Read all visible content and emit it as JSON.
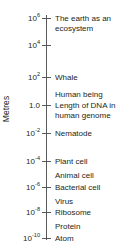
{
  "chart_data": {
    "type": "scatter",
    "title": "",
    "orientation": "vertical",
    "scale": "log10",
    "ylabel": "Metres",
    "ylim": [
      1e-10,
      1000000.0
    ],
    "grid": false,
    "legend": null,
    "axis_ticks": [
      {
        "label_base": "10",
        "label_exp": "6",
        "plain": "10^6",
        "value": 1000000.0,
        "y": 18
      },
      {
        "label_base": "10",
        "label_exp": "4",
        "plain": "10^4",
        "value": 10000.0,
        "y": 45
      },
      {
        "label_base": "10",
        "label_exp": "2",
        "plain": "10^2",
        "value": 100,
        "y": 77
      },
      {
        "label_base": "1.0",
        "label_exp": "",
        "plain": "1.0",
        "value": 1,
        "y": 105
      },
      {
        "label_base": "10",
        "label_exp": "-2",
        "plain": "10^-2",
        "value": 0.01,
        "y": 133
      },
      {
        "label_base": "10",
        "label_exp": "-4",
        "plain": "10^-4",
        "value": 0.0001,
        "y": 161
      },
      {
        "label_base": "10",
        "label_exp": "-6",
        "plain": "10^-6",
        "value": 1e-06,
        "y": 187
      },
      {
        "label_base": "10",
        "label_exp": "-8",
        "plain": "10^-8",
        "value": 1e-08,
        "y": 212
      },
      {
        "label_base": "10",
        "label_exp": "-10",
        "plain": "10^-10",
        "value": 1e-10,
        "y": 238
      }
    ],
    "annotations": [
      {
        "text": "The earth as an ecosystem",
        "value": 1000000.0,
        "y": 14,
        "at_tick": true
      },
      {
        "text": "Whale",
        "value": 100,
        "y": 73,
        "at_tick": true
      },
      {
        "text": "Human being",
        "value": 2,
        "y": 90,
        "at_tick": false
      },
      {
        "text": "Length of DNA in\nhuman genome",
        "value": 1,
        "y": 101,
        "at_tick": true
      },
      {
        "text": "Nematode",
        "value": 0.01,
        "y": 129,
        "at_tick": true
      },
      {
        "text": "Plant cell",
        "value": 0.0001,
        "y": 157,
        "at_tick": true
      },
      {
        "text": "Animal cell",
        "value": 1e-05,
        "y": 171,
        "at_tick": false
      },
      {
        "text": "Bacterial cell",
        "value": 1e-06,
        "y": 183,
        "at_tick": true
      },
      {
        "text": "Virus",
        "value": 1e-07,
        "y": 197,
        "at_tick": false
      },
      {
        "text": "Ribosome",
        "value": 1e-08,
        "y": 208,
        "at_tick": true
      },
      {
        "text": "Protein",
        "value": 1e-09,
        "y": 222,
        "at_tick": false
      },
      {
        "text": "Atom",
        "value": 1e-10,
        "y": 234,
        "at_tick": true
      }
    ],
    "colors": {
      "axis": "#58595b",
      "text": "#231f20",
      "background": "#ffffff"
    }
  }
}
